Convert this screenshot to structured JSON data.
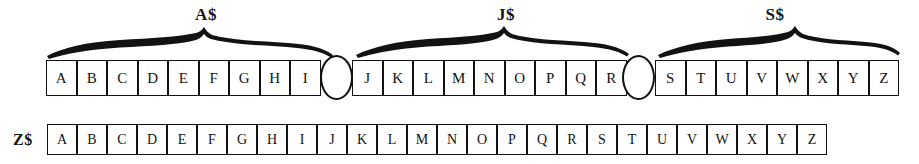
{
  "figure": {
    "background_color": "#ffffff",
    "ink_color": "#121212"
  },
  "braces": [
    {
      "label": "A$",
      "spans": "A through I"
    },
    {
      "label": "J$",
      "spans": "J through R"
    },
    {
      "label": "S$",
      "spans": "S through Z"
    }
  ],
  "top_row": {
    "segments": [
      {
        "name": "A$",
        "cells": [
          "A",
          "B",
          "C",
          "D",
          "E",
          "F",
          "G",
          "H",
          "I"
        ]
      },
      {
        "name": "J$",
        "cells": [
          "J",
          "K",
          "L",
          "M",
          "N",
          "O",
          "P",
          "Q",
          "R"
        ]
      },
      {
        "name": "S$",
        "cells": [
          "S",
          "T",
          "U",
          "V",
          "W",
          "X",
          "Y",
          "Z"
        ]
      }
    ],
    "separators": [
      "oval",
      "oval"
    ]
  },
  "bottom_row": {
    "label": "Z$",
    "cells": [
      "A",
      "B",
      "C",
      "D",
      "E",
      "F",
      "G",
      "H",
      "I",
      "J",
      "K",
      "L",
      "M",
      "N",
      "O",
      "P",
      "Q",
      "R",
      "S",
      "T",
      "U",
      "V",
      "W",
      "X",
      "Y",
      "Z"
    ]
  }
}
